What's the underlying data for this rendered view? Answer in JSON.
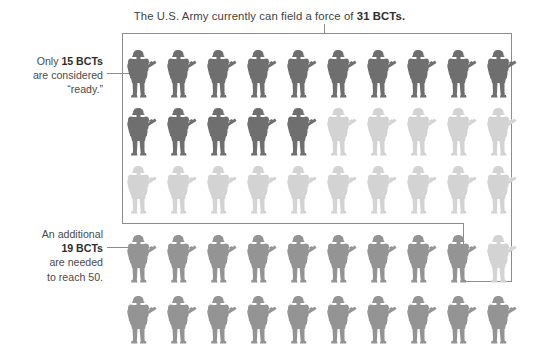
{
  "headline": {
    "text_before": "The U.S. Army currently can field a force of ",
    "emphasis": "31 BCTs."
  },
  "annotations": [
    {
      "id": "ready",
      "name": "annotation-ready",
      "lines": [
        {
          "text": "Only ",
          "bold": false
        },
        {
          "text": "15 BCTs",
          "bold": true
        },
        {
          "text": " are considered “ready.”",
          "bold": false
        }
      ],
      "plain": "Only 15 BCTs are considered “ready.”",
      "line1_pre": "Only ",
      "line1_bold": "15 BCTs",
      "line2": "are considered",
      "line3": "“ready.”"
    },
    {
      "id": "needed",
      "name": "annotation-needed",
      "plain": "An additional 19 BCTs are needed to reach 50.",
      "line1": "An additional",
      "line2_bold": "19 BCTs",
      "line3": "are needed",
      "line4": "to reach 50."
    }
  ],
  "colors": {
    "dark": "#6f6f6f",
    "medium": "#949494",
    "light": "#d3d3d3",
    "box_stroke": "#8d8d8d",
    "text": "#4a4a4a",
    "background": "#ffffff"
  },
  "chart_data": {
    "type": "pictogram",
    "title": "The U.S. Army currently can field a force of 31 BCTs.",
    "unit": "1 soldier icon = 1 BCT (Brigade Combat Team)",
    "icon": "soldier-icon",
    "columns": 10,
    "total_icons": 50,
    "categories": [
      "Ready BCTs",
      "Fielded but not ready",
      "Additional BCTs needed",
      "Shortfall placeholder"
    ],
    "values": [
      15,
      16,
      19,
      0
    ],
    "series": [
      {
        "name": "Ready BCTs",
        "shade": "dark",
        "color": "#6f6f6f",
        "count": 15
      },
      {
        "name": "Fielded, not ready",
        "shade": "light",
        "color": "#d3d3d3",
        "count": 16
      },
      {
        "name": "Additional BCTs needed to reach 50",
        "shade": "medium",
        "color": "#949494",
        "count": 19
      }
    ],
    "annotations": [
      "Only 15 BCTs are considered “ready.”",
      "An additional 19 BCTs are needed to reach 50."
    ],
    "rows": [
      {
        "index": 1,
        "shades": [
          "dark",
          "dark",
          "dark",
          "dark",
          "dark",
          "dark",
          "dark",
          "dark",
          "dark",
          "dark"
        ]
      },
      {
        "index": 2,
        "shades": [
          "dark",
          "dark",
          "dark",
          "dark",
          "dark",
          "light",
          "light",
          "light",
          "light",
          "light"
        ]
      },
      {
        "index": 3,
        "shades": [
          "light",
          "light",
          "light",
          "light",
          "light",
          "light",
          "light",
          "light",
          "light",
          "light"
        ]
      },
      {
        "index": 4,
        "shades": [
          "medium",
          "medium",
          "medium",
          "medium",
          "medium",
          "medium",
          "medium",
          "medium",
          "medium",
          "light"
        ]
      },
      {
        "index": 5,
        "shades": [
          "medium",
          "medium",
          "medium",
          "medium",
          "medium",
          "medium",
          "medium",
          "medium",
          "medium",
          "medium"
        ]
      }
    ],
    "notes": {
      "boxed_group": "Outlined box encloses the 31 BCTs currently fielded (rows 1-3 plus the single light icon in row 4).",
      "target_force": 50
    }
  }
}
